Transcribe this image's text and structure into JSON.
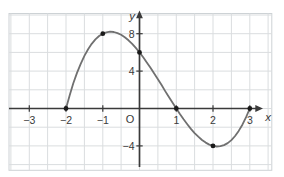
{
  "chart_data": {
    "type": "line",
    "title": "",
    "xlabel": "x",
    "ylabel": "y",
    "origin_label": "O",
    "xlim": [
      -3.55,
      3.6
    ],
    "ylim": [
      -6.6,
      10.2
    ],
    "grid": {
      "on": true,
      "x_step": 0.5,
      "y_step": 2
    },
    "x_ticks": [
      {
        "v": -3,
        "label": "−3"
      },
      {
        "v": -2,
        "label": "−2"
      },
      {
        "v": -1,
        "label": "−1"
      },
      {
        "v": 1,
        "label": "1"
      },
      {
        "v": 2,
        "label": "2"
      },
      {
        "v": 3,
        "label": "3"
      }
    ],
    "y_ticks": [
      {
        "v": 8,
        "label": "8"
      },
      {
        "v": 4,
        "label": "4"
      },
      {
        "v": -4,
        "label": "−4"
      }
    ],
    "series": [
      {
        "name": "cubic-curve",
        "x": [
          -2,
          -1.9,
          -1.8,
          -1.7,
          -1.6,
          -1.5,
          -1.4,
          -1.3,
          -1.2,
          -1.1,
          -1,
          -0.9,
          -0.8,
          -0.7,
          -0.6,
          -0.5,
          -0.4,
          -0.3,
          -0.2,
          -0.1,
          0,
          0.1,
          0.2,
          0.3,
          0.4,
          0.5,
          0.6,
          0.7,
          0.8,
          0.9,
          1,
          1.1,
          1.2,
          1.3,
          1.4,
          1.5,
          1.6,
          1.7,
          1.8,
          1.9,
          2,
          2.1,
          2.2,
          2.3,
          2.4,
          2.5,
          2.6,
          2.7,
          2.8,
          2.9,
          3
        ],
        "y": [
          0,
          1.42,
          2.69,
          3.81,
          4.78,
          5.63,
          6.34,
          6.92,
          7.39,
          7.75,
          8,
          8.15,
          8.21,
          8.18,
          8.06,
          7.88,
          7.62,
          7.29,
          6.91,
          6.48,
          6,
          5.48,
          4.93,
          4.35,
          3.74,
          3.13,
          2.5,
          1.86,
          1.23,
          0.61,
          0,
          -0.59,
          -1.15,
          -1.68,
          -2.18,
          -2.63,
          -3.02,
          -3.37,
          -3.65,
          -3.86,
          -4,
          -4.06,
          -4.03,
          -3.91,
          -3.7,
          -3.38,
          -2.94,
          -2.4,
          -1.73,
          -0.93,
          0
        ]
      }
    ],
    "marked_points": [
      {
        "x": -2,
        "y": 0
      },
      {
        "x": -1,
        "y": 8
      },
      {
        "x": 0,
        "y": 6
      },
      {
        "x": 1,
        "y": 0
      },
      {
        "x": 2,
        "y": -4
      },
      {
        "x": 3,
        "y": 0
      }
    ],
    "colors": {
      "background": "#ffffff",
      "grid": "#dadddf",
      "frame": "#cdd2d5",
      "axis": "#3a3a3a",
      "curve": "#707070",
      "points": "#1a1a1a",
      "labels": "#3a3a3a"
    }
  }
}
